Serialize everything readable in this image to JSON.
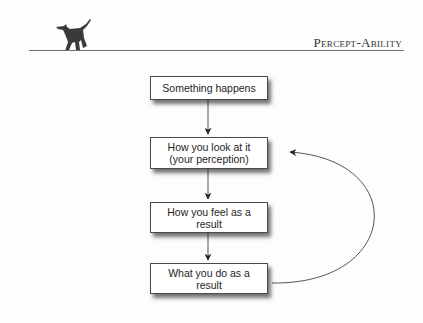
{
  "header": {
    "running_head": "Percept-Ability",
    "logo_icon": "walking-cat-icon"
  },
  "diagram": {
    "type": "flowchart",
    "nodes": [
      {
        "id": "n1",
        "label": "Something happens"
      },
      {
        "id": "n2",
        "label": "How you look at it (your perception)"
      },
      {
        "id": "n3",
        "label": "How you feel as a result"
      },
      {
        "id": "n4",
        "label": "What you do as a result"
      }
    ],
    "edges": [
      {
        "from": "n1",
        "to": "n2"
      },
      {
        "from": "n2",
        "to": "n3"
      },
      {
        "from": "n3",
        "to": "n4"
      },
      {
        "from": "n4",
        "to": "n2",
        "style": "curved-feedback"
      }
    ],
    "colors": {
      "stroke": "#4a4a4a",
      "box_fill": "#ffffff",
      "text": "#1e1e1e"
    }
  }
}
